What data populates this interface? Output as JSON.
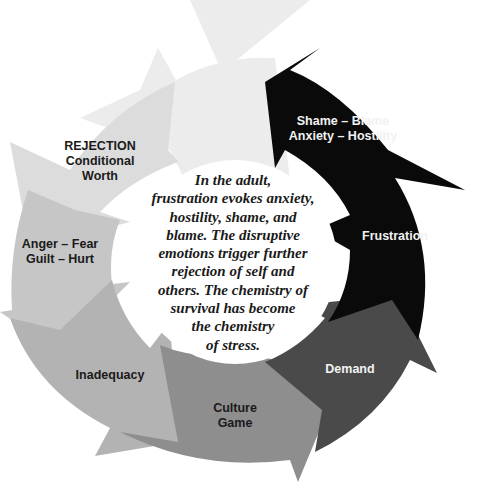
{
  "diagram": {
    "type": "cycle",
    "direction": "counterclockwise",
    "colors": {
      "top": "#ececec",
      "rejection": "#dcdcdc",
      "anger": "#c6c6c6",
      "inadequacy": "#b3b3b3",
      "culture": "#8e8e8e",
      "demand": "#4a4a4a",
      "frustration": "#0a0a0a",
      "background": "#ffffff"
    },
    "segments": [
      {
        "id": "shame",
        "line1": "Shame – Blame",
        "line2": "Anxiety – Hostility"
      },
      {
        "id": "frustration",
        "line1": "Frustration"
      },
      {
        "id": "demand",
        "line1": "Demand"
      },
      {
        "id": "culture",
        "line1": "Culture",
        "line2": "Game"
      },
      {
        "id": "inadequacy",
        "line1": "Inadequacy"
      },
      {
        "id": "anger",
        "line1": "Anger – Fear",
        "line2": "Guilt – Hurt"
      },
      {
        "id": "rejection",
        "line1": "REJECTION",
        "line2": "Conditional",
        "line3": "Worth"
      }
    ],
    "center_text": {
      "lines": [
        "In the adult,",
        "frustration evokes anxiety,",
        "hostility, shame, and",
        "blame. The disruptive",
        "emotions trigger further",
        "rejection of self and",
        "others. The chemistry of",
        "survival has become",
        "the chemistry",
        "of stress."
      ]
    }
  }
}
